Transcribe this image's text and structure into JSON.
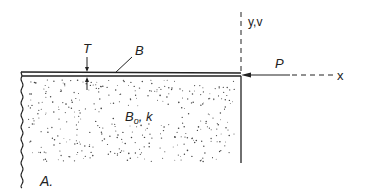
{
  "diagram": {
    "labels": {
      "thickness": "T",
      "plate": "B",
      "force": "P",
      "y_axis": "y,v",
      "x_axis": "x",
      "foundation": "B",
      "foundation_sub": "o",
      "foundation_k": ", k",
      "panel": "A."
    },
    "colors": {
      "line": "#222222",
      "dots": "#444444",
      "background": "#ffffff"
    }
  }
}
